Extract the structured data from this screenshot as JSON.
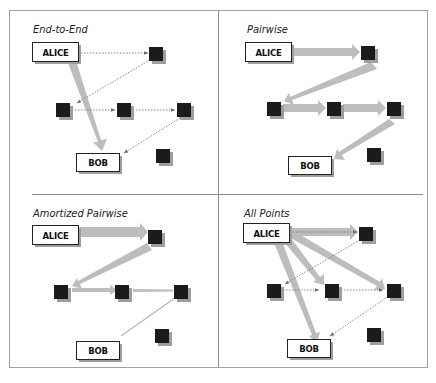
{
  "figure": {
    "colors": {
      "background": "#ffffff",
      "frame": "#9a9a9a",
      "divider": "#8c8c8c",
      "node_fill": "#1b1b1b",
      "node_shadow": "#9e9e9e",
      "box_border": "#222222",
      "thick_arrow": "#bdbdbd",
      "thin_arrow": "#7a7a7a"
    },
    "panels": [
      {
        "id": "end-to-end",
        "title": "End-to-End",
        "alice_label": "ALICE",
        "bob_label": "BOB",
        "description": "ALICE sends directly to BOB (thick arrow); signals pass through intermediate nodes as dotted arrows"
      },
      {
        "id": "pairwise",
        "title": "Pairwise",
        "alice_label": "ALICE",
        "bob_label": "BOB",
        "description": "Data passes hop-by-hop between each pair of nodes via thick arrows"
      },
      {
        "id": "amortized-pairwise",
        "title": "Amortized Pairwise",
        "alice_label": "ALICE",
        "bob_label": "BOB",
        "description": "Thick arrows that thin out along the path, ending with a thin line to BOB"
      },
      {
        "id": "all-points",
        "title": "All Points",
        "alice_label": "ALICE",
        "bob_label": "BOB",
        "description": "ALICE sends thick arrows to every node and BOB; dotted arrows chain between nodes"
      }
    ]
  }
}
